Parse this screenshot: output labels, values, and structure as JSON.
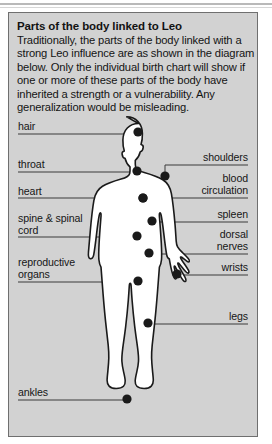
{
  "panel": {
    "title": "Parts of the body linked to Leo",
    "body": "Traditionally, the parts of the body linked with a strong Leo influence are as shown in the diagram below. Only the individual birth chart will show if one or more of these parts of the body have inherited a strength or a vulnerability. Any generalization would be misleading."
  },
  "diagram": {
    "figure_name": "human-body-silhouette",
    "colors": {
      "panel_background": "#d2d2d2",
      "figure_fill": "#ffffff",
      "figure_outline": "#1a1a1a",
      "marker": "#1a1a1a",
      "leader_line": "#3a3a3a",
      "text": "#161616",
      "panel_border": "#6f6f6f"
    },
    "labels": [
      {
        "id": "hair",
        "text": "hair",
        "side": "left",
        "text_x": 9,
        "text_y": 108,
        "line_y": 121,
        "line_x1": 9,
        "line_x2": 129,
        "dot_x": 129,
        "dot_y": 119
      },
      {
        "id": "throat",
        "text": "throat",
        "side": "left",
        "text_x": 9,
        "text_y": 146,
        "line_y": 159,
        "line_x1": 9,
        "line_x2": 128,
        "dot_x": 128,
        "dot_y": 158
      },
      {
        "id": "heart",
        "text": "heart",
        "side": "left",
        "text_x": 9,
        "text_y": 173,
        "line_y": 185,
        "line_x1": 9,
        "line_x2": 134,
        "dot_x": 134,
        "dot_y": 185
      },
      {
        "id": "spine-spinal-cord",
        "text": "spine & spinal\ncord",
        "side": "left",
        "text_x": 9,
        "text_y": 200,
        "line_y": 224,
        "line_x1": 9,
        "line_x2": 128,
        "dot_x": 128,
        "dot_y": 223
      },
      {
        "id": "reproductive-organs",
        "text": "reproductive\norgans",
        "side": "left",
        "text_x": 9,
        "text_y": 244,
        "line_y": 269,
        "line_x1": 9,
        "line_x2": 129,
        "dot_x": 129,
        "dot_y": 268
      },
      {
        "id": "ankles",
        "text": "ankles",
        "side": "left",
        "text_x": 9,
        "text_y": 374,
        "line_y": 387,
        "line_x1": 9,
        "line_x2": 118,
        "dot_x": 118,
        "dot_y": 386
      },
      {
        "id": "shoulders",
        "text": "shoulders",
        "side": "right",
        "text_x": 239,
        "text_y": 139,
        "line_y": 152,
        "line_x1": 156,
        "line_x2": 239,
        "dot_x": 156,
        "dot_y": 163
      },
      {
        "id": "blood-circulation",
        "text": "blood\ncirculation",
        "side": "right",
        "text_x": 239,
        "text_y": 160,
        "line_y": 185,
        "line_x1": 134,
        "line_x2": 239,
        "dot_x": 134,
        "dot_y": 185
      },
      {
        "id": "spleen",
        "text": "spleen",
        "side": "right",
        "text_x": 239,
        "text_y": 196,
        "line_y": 209,
        "line_x1": 143,
        "line_x2": 239,
        "dot_x": 143,
        "dot_y": 208
      },
      {
        "id": "dorsal-nerves",
        "text": "dorsal\nnerves",
        "side": "right",
        "text_x": 239,
        "text_y": 216,
        "line_y": 241,
        "line_x1": 140,
        "line_x2": 239,
        "dot_x": 140,
        "dot_y": 240
      },
      {
        "id": "wrists",
        "text": "wrists",
        "side": "right",
        "text_x": 239,
        "text_y": 249,
        "line_y": 262,
        "line_x1": 168,
        "line_x2": 239,
        "dot_x": 168,
        "dot_y": 261
      },
      {
        "id": "legs",
        "text": "legs",
        "side": "right",
        "text_x": 239,
        "text_y": 298,
        "line_y": 311,
        "line_x1": 139,
        "line_x2": 239,
        "dot_x": 139,
        "dot_y": 310
      }
    ]
  }
}
